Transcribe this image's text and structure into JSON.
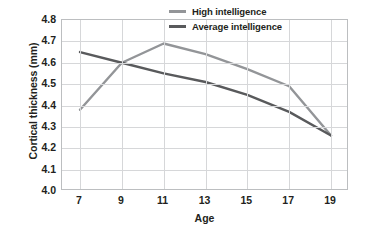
{
  "chart_data": {
    "type": "line",
    "title": "",
    "xlabel": "Age",
    "ylabel": "Cortical thickness (mm)",
    "x": [
      7,
      9,
      11,
      13,
      15,
      17,
      19
    ],
    "categories": [
      "7",
      "9",
      "11",
      "13",
      "15",
      "17",
      "19"
    ],
    "xlim": [
      7,
      19
    ],
    "ylim": [
      4.0,
      4.8
    ],
    "yticks": [
      "4.0",
      "4.1",
      "4.2",
      "4.3",
      "4.4",
      "4.5",
      "4.6",
      "4.7",
      "4.8"
    ],
    "ytick_values": [
      4.0,
      4.1,
      4.2,
      4.3,
      4.4,
      4.5,
      4.6,
      4.7,
      4.8
    ],
    "grid": true,
    "legend_position": "top-right",
    "series": [
      {
        "name": "High intelligence",
        "color": "#939598",
        "values": [
          4.38,
          4.6,
          4.69,
          4.64,
          4.57,
          4.49,
          4.26
        ]
      },
      {
        "name": "Average intelligence",
        "color": "#595a5c",
        "values": [
          4.65,
          4.6,
          4.55,
          4.51,
          4.45,
          4.37,
          4.26
        ]
      }
    ]
  },
  "legend": {
    "items": [
      {
        "label": "High intelligence",
        "color": "#939598"
      },
      {
        "label": "Average intelligence",
        "color": "#595a5c"
      }
    ]
  },
  "colors": {
    "high_intelligence": "#939598",
    "average_intelligence": "#595a5c",
    "grid": "#d6d7d9",
    "frame": "#bcbec0",
    "text": "#231f20",
    "background": "#ffffff"
  }
}
